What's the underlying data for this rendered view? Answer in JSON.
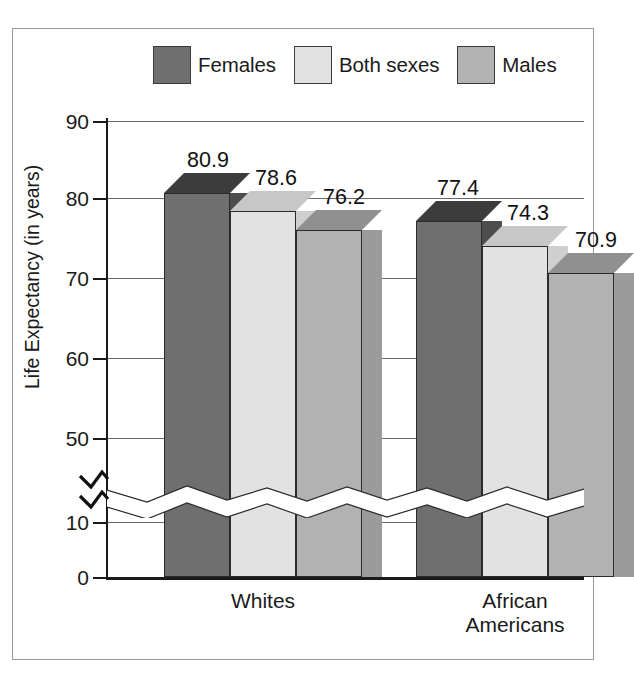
{
  "chart_data": {
    "type": "bar",
    "title": "",
    "xlabel": "",
    "ylabel": "Life Expectancy (in years)",
    "categories": [
      "Whites",
      "African Americans"
    ],
    "category_lines": [
      [
        "Whites"
      ],
      [
        "African",
        "Americans"
      ]
    ],
    "series": [
      {
        "name": "Females",
        "color": "#6f6f6f",
        "values": [
          80.9,
          77.4
        ]
      },
      {
        "name": "Both sexes",
        "color": "#e2e2e2",
        "values": [
          78.6,
          74.3
        ]
      },
      {
        "name": "Males",
        "color": "#b2b2b2",
        "values": [
          76.2,
          70.9
        ]
      }
    ],
    "ylim": [
      0,
      90
    ],
    "yticks": [
      0,
      10,
      50,
      60,
      70,
      80,
      90
    ],
    "ytick_labels": [
      "0",
      "10",
      "50",
      "60",
      "70",
      "80",
      "90"
    ],
    "axis_break": {
      "present": true,
      "between": [
        10,
        50
      ],
      "style": "zigzag"
    },
    "gridlines": true,
    "legend_position": "top",
    "three_d": true
  },
  "legend": {
    "items": [
      {
        "label": "Females",
        "swatch_class": "sw-females"
      },
      {
        "label": "Both sexes",
        "swatch_class": "sw-both"
      },
      {
        "label": "Males",
        "swatch_class": "sw-males"
      }
    ]
  },
  "axis": {
    "y_title": "Life Expectancy (in years)",
    "ticks": [
      {
        "value": "90",
        "y": 3
      },
      {
        "value": "80",
        "y": 80
      },
      {
        "value": "70",
        "y": 160
      },
      {
        "value": "60",
        "y": 240
      },
      {
        "value": "50",
        "y": 320
      },
      {
        "value": "10",
        "y": 404
      },
      {
        "value": "0",
        "y": 459
      }
    ]
  },
  "bars": [
    {
      "group": "Whites",
      "series": "Females",
      "label": "80.9",
      "left": 58,
      "width": 66,
      "height": 384,
      "cls": "c-f",
      "lx": 102,
      "ly": -48
    },
    {
      "group": "Whites",
      "series": "Both sexes",
      "label": "78.6",
      "left": 124,
      "width": 66,
      "height": 366,
      "cls": "c-b",
      "lx": 170,
      "ly": -44
    },
    {
      "group": "Whites",
      "series": "Males",
      "label": "76.2",
      "left": 190,
      "width": 66,
      "height": 347,
      "cls": "c-m",
      "lx": 238,
      "ly": -42
    },
    {
      "group": "African Americans",
      "series": "Females",
      "label": "77.4",
      "left": 310,
      "width": 66,
      "height": 356,
      "cls": "c-f",
      "lx": 352,
      "ly": -48
    },
    {
      "group": "African Americans",
      "series": "Both sexes",
      "label": "74.3",
      "left": 376,
      "width": 66,
      "height": 331,
      "cls": "c-b",
      "lx": 422,
      "ly": -44
    },
    {
      "group": "African Americans",
      "series": "Males",
      "label": "70.9",
      "left": 442,
      "width": 66,
      "height": 304,
      "cls": "c-m",
      "lx": 490,
      "ly": -42
    }
  ],
  "categories": [
    {
      "lines": [
        "Whites"
      ],
      "x": 157
    },
    {
      "lines": [
        "African",
        "Americans"
      ],
      "x": 409
    }
  ]
}
